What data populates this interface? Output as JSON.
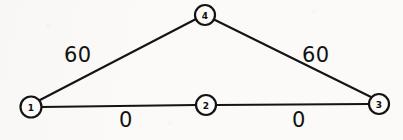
{
  "diagram": {
    "type": "node-link-graph",
    "background_color": "#fbfaf8",
    "ink_color": "#131313",
    "width": 403,
    "height": 140,
    "nodes": [
      {
        "id": "1",
        "label": "1",
        "cx": 31,
        "cy": 107,
        "r": 10.5
      },
      {
        "id": "2",
        "label": "2",
        "cx": 206,
        "cy": 105,
        "r": 10.0
      },
      {
        "id": "3",
        "label": "3",
        "cx": 379,
        "cy": 104,
        "r": 10.0
      },
      {
        "id": "4",
        "label": "4",
        "cx": 205,
        "cy": 15,
        "r": 10.0
      }
    ],
    "edges": [
      {
        "id": "edge-1-4",
        "from": "1",
        "to": "4",
        "weight": "60",
        "x1": 40,
        "y1": 100,
        "x2": 196,
        "y2": 19,
        "label_x": 64,
        "label_y": 45
      },
      {
        "id": "edge-4-3",
        "from": "4",
        "to": "3",
        "weight": "60",
        "x1": 215,
        "y1": 20,
        "x2": 371,
        "y2": 97,
        "label_x": 302,
        "label_y": 45
      },
      {
        "id": "edge-1-2",
        "from": "1",
        "to": "2",
        "weight": "0",
        "x1": 41,
        "y1": 107,
        "x2": 196,
        "y2": 105,
        "label_x": 119,
        "label_y": 110
      },
      {
        "id": "edge-2-3",
        "from": "2",
        "to": "3",
        "weight": "0",
        "x1": 216,
        "y1": 105,
        "x2": 369,
        "y2": 104,
        "label_x": 292,
        "label_y": 110
      }
    ]
  }
}
